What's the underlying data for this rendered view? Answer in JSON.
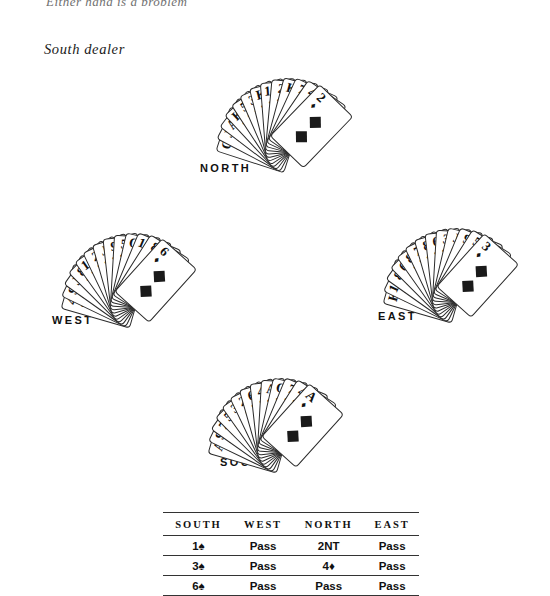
{
  "page": {
    "top_cut_text": "Either hand is a problem",
    "dealer_note": "South dealer"
  },
  "hands": {
    "north": {
      "label": "NORTH",
      "cards": [
        {
          "rank": "Q",
          "suit": "♠"
        },
        {
          "rank": "J",
          "suit": "♠"
        },
        {
          "rank": "A",
          "suit": "♠"
        },
        {
          "rank": "K",
          "suit": "♥"
        },
        {
          "rank": "5",
          "suit": "♥"
        },
        {
          "rank": "3",
          "suit": "♠"
        },
        {
          "rank": "K",
          "suit": "♣"
        },
        {
          "rank": "10",
          "suit": "♣"
        },
        {
          "rank": "2",
          "suit": "♣"
        },
        {
          "rank": "K",
          "suit": "♦"
        },
        {
          "rank": "7",
          "suit": "♦"
        },
        {
          "rank": "4",
          "suit": "♦"
        },
        {
          "rank": "2",
          "suit": "♦"
        }
      ]
    },
    "west": {
      "label": "WEST",
      "cards": [
        {
          "rank": "4",
          "suit": "♣"
        },
        {
          "rank": "9",
          "suit": "♠"
        },
        {
          "rank": "J",
          "suit": "♠"
        },
        {
          "rank": "8",
          "suit": "♥"
        },
        {
          "rank": "10",
          "suit": "♥"
        },
        {
          "rank": "2",
          "suit": "♥"
        },
        {
          "rank": "J",
          "suit": "♣"
        },
        {
          "rank": "9",
          "suit": "♣"
        },
        {
          "rank": "5",
          "suit": "♣"
        },
        {
          "rank": "Q",
          "suit": "♦"
        },
        {
          "rank": "10",
          "suit": "♦"
        },
        {
          "rank": "8",
          "suit": "♦"
        },
        {
          "rank": "6",
          "suit": "♦"
        }
      ]
    },
    "east": {
      "label": "EAST",
      "cards": [
        {
          "rank": "K",
          "suit": "♠"
        },
        {
          "rank": "10",
          "suit": "♠"
        },
        {
          "rank": "8",
          "suit": "♠"
        },
        {
          "rank": "6",
          "suit": "♠"
        },
        {
          "rank": "8",
          "suit": "♥"
        },
        {
          "rank": "7",
          "suit": "♥"
        },
        {
          "rank": "8",
          "suit": "♣"
        },
        {
          "rank": "6",
          "suit": "♣"
        },
        {
          "rank": "3",
          "suit": "♣"
        },
        {
          "rank": "J",
          "suit": "♦"
        },
        {
          "rank": "9",
          "suit": "♦"
        },
        {
          "rank": "5",
          "suit": "♦"
        },
        {
          "rank": "3",
          "suit": "♦"
        }
      ]
    },
    "south": {
      "label": "SOUTH",
      "cards": [
        {
          "rank": "A",
          "suit": "♠"
        },
        {
          "rank": "9",
          "suit": "♠"
        },
        {
          "rank": "7",
          "suit": "♠"
        },
        {
          "rank": "5",
          "suit": "♠"
        },
        {
          "rank": "3",
          "suit": "♠"
        },
        {
          "rank": "2",
          "suit": "♠"
        },
        {
          "rank": "6",
          "suit": "♥"
        },
        {
          "rank": "4",
          "suit": "♥"
        },
        {
          "rank": "A",
          "suit": "♣"
        },
        {
          "rank": "Q",
          "suit": "♣"
        },
        {
          "rank": "7",
          "suit": "♣"
        },
        {
          "rank": "4",
          "suit": "♣"
        },
        {
          "rank": "A",
          "suit": "♦"
        }
      ]
    }
  },
  "bidding": {
    "headers": [
      "SOUTH",
      "WEST",
      "NORTH",
      "EAST"
    ],
    "rows": [
      [
        "1♠",
        "Pass",
        "2NT",
        "Pass"
      ],
      [
        "3♠",
        "Pass",
        "4♦",
        "Pass"
      ],
      [
        "6♠",
        "Pass",
        "Pass",
        "Pass"
      ]
    ]
  }
}
